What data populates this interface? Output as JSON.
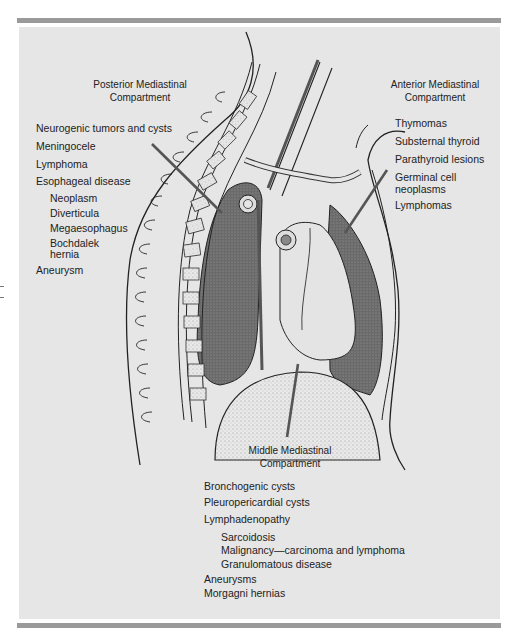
{
  "figure": {
    "posterior": {
      "title_line1": "Posterior Mediastinal",
      "title_line2": "Compartment",
      "items": [
        {
          "label": "Neurogenic tumors and cysts",
          "indent": 0
        },
        {
          "label": "Meningocele",
          "indent": 0
        },
        {
          "label": "Lymphoma",
          "indent": 0
        },
        {
          "label": "Esophageal disease",
          "indent": 0
        },
        {
          "label": "Neoplasm",
          "indent": 1
        },
        {
          "label": "Diverticula",
          "indent": 1
        },
        {
          "label": "Megaesophagus",
          "indent": 1
        },
        {
          "label": "Bochdalek",
          "indent": 1
        },
        {
          "label": "hernia",
          "indent": 1
        },
        {
          "label": "Aneurysm",
          "indent": 0
        }
      ]
    },
    "anterior": {
      "title_line1": "Anterior Mediastinal",
      "title_line2": "Compartment",
      "items": [
        {
          "label": "Thymomas"
        },
        {
          "label": "Substernal thyroid"
        },
        {
          "label": "Parathyroid lesions"
        },
        {
          "label": "Germinal cell"
        },
        {
          "label": "neoplasms"
        },
        {
          "label": "Lymphomas"
        }
      ]
    },
    "middle": {
      "title_line1": "Middle Mediastinal",
      "title_line2": "Compartment",
      "items": [
        {
          "label": "Bronchogenic cysts",
          "indent": 0
        },
        {
          "label": "Pleuropericardial cysts",
          "indent": 0
        },
        {
          "label": "Lymphadenopathy",
          "indent": 0
        },
        {
          "label": "Sarcoidosis",
          "indent": 1
        },
        {
          "label": "Malignancy—carcinoma and lymphoma",
          "indent": 1
        },
        {
          "label": "Granulomatous disease",
          "indent": 1
        },
        {
          "label": "Aneurysms",
          "indent": 0
        },
        {
          "label": "Morgagni hernias",
          "indent": 0
        }
      ]
    },
    "colors": {
      "panel": "#e6e6e6",
      "rule": "#9a9a9a",
      "pointer": "#555555",
      "lung_shade": "#6e6e6e",
      "ink": "#222222"
    }
  }
}
